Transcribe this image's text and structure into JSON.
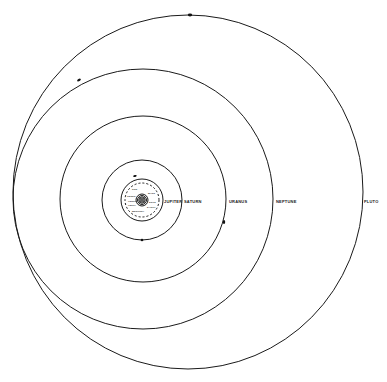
{
  "planets_outer": [
    {
      "name": "JUPITER"
    },
    {
      "name": "SATURN"
    },
    {
      "name": "URANUS"
    },
    {
      "name": "NEPTUNE"
    },
    {
      "name": "PLUTO"
    }
  ],
  "inner_labels": [
    "SUN",
    "MARS",
    "EROS",
    "EARTH",
    "VENUS",
    "MERCURY",
    "CERES",
    "VESTA"
  ],
  "colors": {
    "line": "#1a1a1a",
    "background": "#ffffff"
  }
}
